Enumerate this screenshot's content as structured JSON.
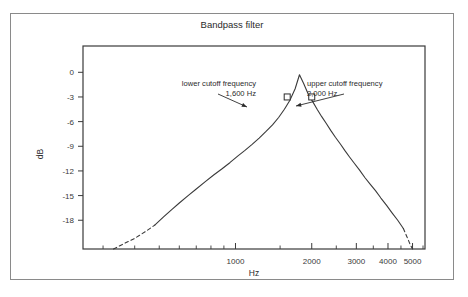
{
  "figure": {
    "border_color": "#8a8a8a",
    "background": "#ffffff"
  },
  "chart_data": {
    "type": "line",
    "title": "Bandpass filter",
    "xlabel": "Hz",
    "ylabel": "dB",
    "xscale": "log",
    "xlim": [
      250,
      5600
    ],
    "ylim": [
      -21.5,
      3.2
    ],
    "grid": false,
    "x_major_ticks": [
      1000,
      2000,
      3000,
      4000,
      5000
    ],
    "x_major_tick_labels": [
      "1000",
      "2000",
      "3000",
      "4000",
      "5000"
    ],
    "x_minor_ticks": [
      300,
      400,
      500,
      600,
      700,
      800,
      900,
      1500,
      2500,
      3500,
      4500,
      5500
    ],
    "y_ticks": [
      0,
      -3,
      -6,
      -9,
      -12,
      -15,
      -18
    ],
    "y_tick_labels": [
      "0",
      "-3",
      "-6",
      "-9",
      "-12",
      "-15",
      "-18"
    ],
    "center_frequency_hz": 1789,
    "peak_db": 0,
    "series": [
      {
        "name": "magnitude response",
        "style": "solid",
        "color": "#3a3a3a",
        "x": [
          480,
          520,
          560,
          600,
          650,
          700,
          760,
          820,
          880,
          950,
          1020,
          1090,
          1160,
          1240,
          1320,
          1400,
          1480,
          1560,
          1640,
          1720,
          1789,
          1860,
          1940,
          2020,
          2100,
          2190,
          2280,
          2380,
          2480,
          2590,
          2700,
          2820,
          2950,
          3090,
          3240,
          3400,
          3570,
          3750,
          3950,
          4150,
          4370,
          4600
        ],
        "y": [
          -18.6,
          -17.6,
          -16.7,
          -15.9,
          -15.0,
          -14.2,
          -13.3,
          -12.5,
          -11.8,
          -11.0,
          -10.2,
          -9.5,
          -8.8,
          -8.0,
          -7.2,
          -6.4,
          -5.5,
          -4.5,
          -3.4,
          -2.0,
          -0.3,
          -1.4,
          -2.7,
          -3.6,
          -4.5,
          -5.4,
          -6.2,
          -7.1,
          -7.9,
          -8.7,
          -9.5,
          -10.3,
          -11.1,
          -11.9,
          -12.8,
          -13.6,
          -14.4,
          -15.3,
          -16.2,
          -17.1,
          -18.0,
          -19.0
        ]
      },
      {
        "name": "lower extrapolation",
        "style": "dashed",
        "color": "#3a3a3a",
        "x": [
          330,
          360,
          400,
          440,
          480
        ],
        "y": [
          -21.5,
          -20.9,
          -20.2,
          -19.4,
          -18.6
        ]
      },
      {
        "name": "upper extrapolation",
        "style": "dashed",
        "color": "#3a3a3a",
        "x": [
          4600,
          4750,
          4900,
          5000
        ],
        "y": [
          -19.0,
          -20.0,
          -21.0,
          -21.5
        ]
      }
    ],
    "markers": [
      {
        "name": "lower-cutoff-marker",
        "x": 1600,
        "y": -3,
        "shape": "square"
      },
      {
        "name": "upper-cutoff-marker",
        "x": 2000,
        "y": -3,
        "shape": "square"
      }
    ],
    "annotations": [
      {
        "name": "lower-cutoff-annotation",
        "line1": "lower cutoff frequency",
        "line2": "1,600 Hz",
        "align": "right",
        "text_x": 245,
        "text_y": 72,
        "arrow_from_x": 207,
        "arrow_from_y": 80,
        "arrow_to_x": 236,
        "arrow_to_y": 93
      },
      {
        "name": "upper-cutoff-annotation",
        "line1": "upper cutoff frequency",
        "line2": "2,000 Hz",
        "align": "left",
        "text_x": 296,
        "text_y": 72,
        "arrow_from_x": 333,
        "arrow_from_y": 80,
        "arrow_to_x": 285,
        "arrow_to_y": 92
      }
    ]
  }
}
